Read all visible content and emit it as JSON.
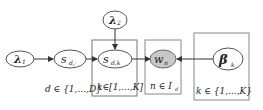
{
  "diagram": {
    "type": "plate-notation graphical model",
    "nodes": [
      {
        "id": "lambda1",
        "label": "λ",
        "sub": "1",
        "observed": false
      },
      {
        "id": "s_d",
        "label": "s",
        "sub": "d,·",
        "observed": false
      },
      {
        "id": "lambda2",
        "label": "λ",
        "sub": "2",
        "observed": false
      },
      {
        "id": "s_dk",
        "label": "s",
        "sub": "d,k",
        "observed": false
      },
      {
        "id": "w_n",
        "label": "w",
        "sub": "n",
        "observed": true
      },
      {
        "id": "beta_k",
        "label": "β",
        "sub": "k",
        "observed": false
      }
    ],
    "edges": [
      {
        "from": "lambda1",
        "to": "s_d"
      },
      {
        "from": "s_d",
        "to": "s_dk"
      },
      {
        "from": "lambda2",
        "to": "s_dk"
      },
      {
        "from": "s_dk",
        "to": "w_n"
      },
      {
        "from": "beta_k",
        "to": "w_n"
      }
    ],
    "plates": [
      {
        "id": "plate_d",
        "label": "d ∈ {1,...,D}"
      },
      {
        "id": "plate_k_inner",
        "label": "k∈[1,...,K]"
      },
      {
        "id": "plate_n",
        "label": "n ∈ I",
        "label_sub": "d"
      },
      {
        "id": "plate_k_beta",
        "label": "k ∈ {1,...,K}"
      }
    ]
  },
  "colors": {
    "stroke": "#555555",
    "observed_fill": "#c8c8c8",
    "latent_fill": "#ffffff",
    "plate_stroke": "#777777"
  }
}
